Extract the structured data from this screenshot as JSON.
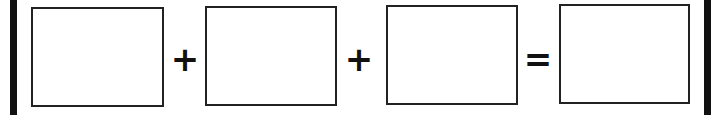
{
  "equation": {
    "boxes": [
      "",
      "",
      "",
      ""
    ],
    "operators": [
      "+",
      "+",
      "="
    ]
  },
  "colors": {
    "stroke": "#222222",
    "bar": "#111111",
    "background": "#ffffff"
  }
}
